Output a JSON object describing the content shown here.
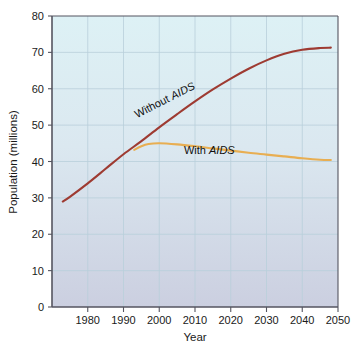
{
  "chart_data": {
    "type": "line",
    "title": "",
    "xlabel": "Year",
    "ylabel": "Population (millions)",
    "xlim": [
      1970,
      2050
    ],
    "ylim": [
      0,
      80
    ],
    "xticks": [
      1980,
      1990,
      2000,
      2010,
      2020,
      2030,
      2040,
      2050
    ],
    "yticks": [
      0,
      10,
      20,
      30,
      40,
      50,
      60,
      70,
      80
    ],
    "xtick_labels": [
      "1980",
      "1990",
      "2000",
      "2010",
      "2020",
      "2030",
      "2040",
      "2050"
    ],
    "ytick_labels": [
      "0",
      "10",
      "20",
      "30",
      "40",
      "50",
      "60",
      "70",
      "80"
    ],
    "grid": true,
    "legend_position": "inline-annotations",
    "plot_background_top": "#dcf0f4",
    "plot_background_bottom": "#ccd0e0",
    "gridline_color": "#b9cfdb",
    "axis_color": "#555560",
    "series": [
      {
        "name": "Without AIDS",
        "color": "#9e3b32",
        "label_text_prefix": "Without ",
        "label_text_italic": "AIDS",
        "label_rotation": -27,
        "x": [
          1973,
          1975,
          1980,
          1985,
          1990,
          1995,
          2000,
          2005,
          2010,
          2015,
          2020,
          2025,
          2030,
          2035,
          2040,
          2045,
          2048
        ],
        "values": [
          29.0,
          30.3,
          34.0,
          38.0,
          42.0,
          45.6,
          49.4,
          53.0,
          56.5,
          59.8,
          62.8,
          65.5,
          67.8,
          69.6,
          70.7,
          71.2,
          71.3
        ]
      },
      {
        "name": "With AIDS",
        "color": "#e8ae52",
        "label_text_prefix": "With ",
        "label_text_italic": "AIDS",
        "label_rotation": 0,
        "x": [
          1993,
          1995,
          1997,
          2000,
          2005,
          2010,
          2015,
          2020,
          2025,
          2030,
          2035,
          2040,
          2045,
          2048
        ],
        "values": [
          43.2,
          44.2,
          44.8,
          45.0,
          44.7,
          44.2,
          43.6,
          43.0,
          42.4,
          41.9,
          41.4,
          40.9,
          40.5,
          40.4
        ]
      }
    ],
    "annotations": [
      {
        "text": "Without AIDS",
        "x": 2002,
        "y": 56.0,
        "rotated": true
      },
      {
        "text": "With AIDS",
        "x": 2014,
        "y": 42.0,
        "rotated": false
      }
    ]
  }
}
